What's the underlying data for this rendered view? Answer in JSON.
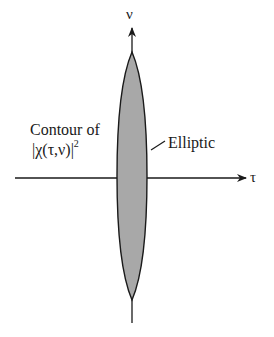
{
  "diagram": {
    "axes": {
      "vertical_label": "ν",
      "horizontal_label": "τ"
    },
    "contour_label": {
      "line1": "Contour of",
      "line2_base": "|χ(τ,ν)|",
      "line2_superscript": "2"
    },
    "shape_label": "Elliptic",
    "colors": {
      "ellipse_fill": "#a8a8a8",
      "ellipse_stroke": "#1a1a1a",
      "axis_stroke": "#1a1a1a",
      "background": "#ffffff"
    }
  }
}
